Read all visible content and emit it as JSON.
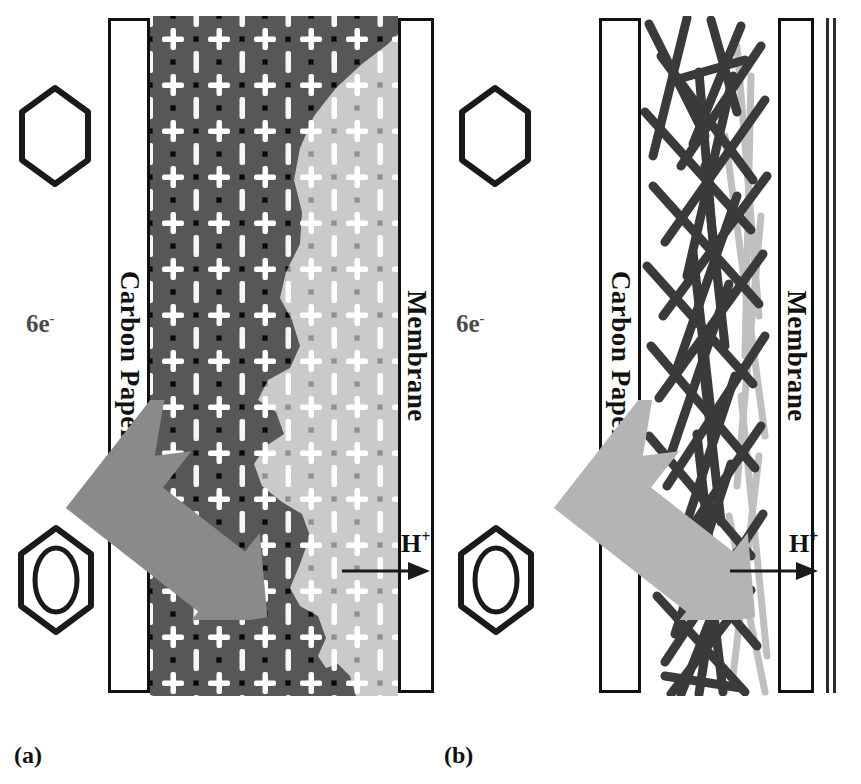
{
  "figure": {
    "type": "schematic-diagram",
    "background_color": "#ffffff"
  },
  "panels": [
    {
      "id": "a",
      "caption": "(a)",
      "caption_x": 14,
      "caption_y": 742,
      "catalyst_type": "carbon-black-particles",
      "reactant_glyph": "cyclohexane-hexagon",
      "product_glyph": "benzene-hexagon-with-inner-ring",
      "electron_label": "6e",
      "electron_superscript": "-",
      "electron_label_x": 26,
      "electron_label_y": 310,
      "left_slab": {
        "label": "Carbon Paper",
        "x": 108,
        "y": 18,
        "w": 42,
        "h": 675
      },
      "right_slab": {
        "label": "Membrane",
        "x": 398,
        "y": 18,
        "w": 36,
        "h": 675
      },
      "active_layer": {
        "x": 150,
        "y": 16,
        "w": 248,
        "h": 680
      },
      "proton_label": "H",
      "proton_superscript": "+",
      "proton_label_x": 401,
      "proton_label_y": 534,
      "proton_arrow_y": 573
    },
    {
      "id": "b",
      "caption": "(b)",
      "caption_x": 444,
      "caption_y": 742,
      "catalyst_type": "carbon-nanotubes",
      "reactant_glyph": "cyclohexane-hexagon",
      "product_glyph": "benzene-hexagon-with-inner-ring",
      "electron_label": "6e",
      "electron_superscript": "-",
      "electron_label_x": 456,
      "electron_label_y": 310,
      "left_slab": {
        "label": "Carbon Paper",
        "x": 599,
        "y": 18,
        "w": 42,
        "h": 675
      },
      "right_slab": {
        "label": "Membrane",
        "x": 778,
        "y": 18,
        "w": 36,
        "h": 675
      },
      "active_layer": {
        "x": 641,
        "y": 16,
        "w": 137,
        "h": 680
      },
      "proton_label": "H",
      "proton_superscript": "+",
      "proton_label_x": 789,
      "proton_label_y": 534,
      "proton_arrow_y": 573
    }
  ],
  "colors": {
    "outline": "#111111",
    "slab_fill": "#ffffff",
    "dark_catalyst_bg": "#070707",
    "dark_particle": "#595959",
    "light_catalyst_bg": "#8e8e8e",
    "light_particle": "#c9c9c9",
    "ionomer_cross": "#ffffff",
    "arrow_fill": "#8a8a8a",
    "arrow_fill_light": "#b4b4b4",
    "nanotube_dark": "#3a3a3a",
    "nanotube_light": "#a8a8a8",
    "electron_text": "#4a4a4a"
  },
  "legend_notes": {
    "reactant_arrow": "broad grey arrow entering from carbon paper into catalyst layer",
    "proton_arrow": "thin black arrow pointing right into the membrane",
    "crosses": "white plus marks representing ionomer / proton conduction sites"
  }
}
